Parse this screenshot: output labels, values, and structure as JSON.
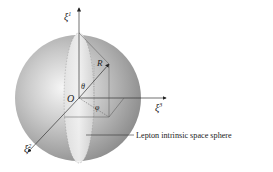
{
  "diagram": {
    "type": "3d-sphere-coordinate-diagram",
    "axes": {
      "xi1": {
        "symbol": "ξ",
        "superscript": "1"
      },
      "xi2": {
        "symbol": "ξ",
        "superscript": "2"
      },
      "xi3": {
        "symbol": "ξ",
        "superscript": "3"
      }
    },
    "labels": {
      "origin": "O",
      "radius": "R",
      "theta": "θ",
      "phi": "φ",
      "callout": "Lepton intrinsic space sphere"
    },
    "colors": {
      "sphere_edge": "#8a8a8a",
      "sphere_highlight": "#f4f4f4",
      "lines": "#333333",
      "background": "#ffffff"
    }
  }
}
